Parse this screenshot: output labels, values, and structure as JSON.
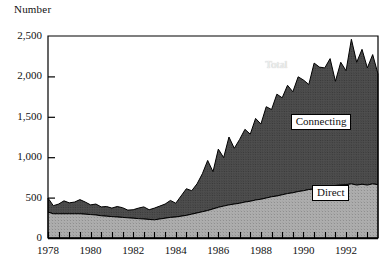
{
  "chart_data": {
    "type": "area",
    "title": "",
    "ylabel": "Number",
    "xlabel": "",
    "ylim": [
      0,
      2500
    ],
    "xlim": [
      1978,
      1993.5
    ],
    "grid": false,
    "stacked": true,
    "legend_position": "inline-annotations",
    "yticks": [
      "0",
      "500",
      "1,000",
      "1,500",
      "2,000",
      "2,500"
    ],
    "ytick_values": [
      0,
      500,
      1000,
      1500,
      2000,
      2500
    ],
    "xticks": [
      "1978",
      "1980",
      "1982",
      "1984",
      "1986",
      "1988",
      "1990",
      "1992"
    ],
    "xtick_values": [
      1978,
      1980,
      1982,
      1984,
      1986,
      1988,
      1990,
      1992
    ],
    "minor_xtick_interval": 0.5,
    "annotations": [
      {
        "text": "Total",
        "x": 1988.2,
        "y": 2130,
        "style": "plain"
      },
      {
        "text": "Connecting",
        "x": 1989.4,
        "y": 1430,
        "style": "boxed"
      },
      {
        "text": "Direct",
        "x": 1990.4,
        "y": 560,
        "style": "boxed"
      }
    ],
    "colors": {
      "direct": "#9e9e9e",
      "connecting": "#4a4a4a",
      "outline": "#000000",
      "background": "#ffffff",
      "text": "#111111"
    },
    "x": [
      1978.0,
      1978.25,
      1978.5,
      1978.75,
      1979.0,
      1979.25,
      1979.5,
      1979.75,
      1980.0,
      1980.25,
      1980.5,
      1980.75,
      1981.0,
      1981.25,
      1981.5,
      1981.75,
      1982.0,
      1982.25,
      1982.5,
      1982.75,
      1983.0,
      1983.25,
      1983.5,
      1983.75,
      1984.0,
      1984.25,
      1984.5,
      1984.75,
      1985.0,
      1985.25,
      1985.5,
      1985.75,
      1986.0,
      1986.25,
      1986.5,
      1986.75,
      1987.0,
      1987.25,
      1987.5,
      1987.75,
      1988.0,
      1988.25,
      1988.5,
      1988.75,
      1989.0,
      1989.25,
      1989.5,
      1989.75,
      1990.0,
      1990.25,
      1990.5,
      1990.75,
      1991.0,
      1991.25,
      1991.5,
      1991.75,
      1992.0,
      1992.25,
      1992.5,
      1992.75,
      1993.0,
      1993.25,
      1993.5
    ],
    "series": [
      {
        "name": "Direct",
        "fill": "#9e9e9e",
        "values": [
          320,
          300,
          300,
          300,
          300,
          300,
          300,
          295,
          290,
          285,
          275,
          270,
          265,
          260,
          255,
          250,
          245,
          240,
          235,
          230,
          225,
          235,
          245,
          255,
          260,
          270,
          280,
          295,
          310,
          325,
          340,
          360,
          380,
          395,
          410,
          420,
          430,
          445,
          455,
          470,
          480,
          495,
          510,
          520,
          535,
          550,
          560,
          575,
          585,
          600,
          605,
          615,
          625,
          640,
          650,
          655,
          660,
          670,
          655,
          665,
          655,
          670,
          660
        ]
      },
      {
        "name": "Connecting",
        "fill": "#4a4a4a",
        "values": [
          175,
          100,
          120,
          160,
          135,
          145,
          175,
          150,
          120,
          135,
          110,
          120,
          105,
          130,
          120,
          95,
          105,
          130,
          150,
          120,
          145,
          160,
          175,
          210,
          170,
          250,
          330,
          290,
          360,
          470,
          620,
          460,
          720,
          600,
          840,
          690,
          790,
          900,
          830,
          1010,
          930,
          1130,
          1080,
          1260,
          1200,
          1340,
          1250,
          1420,
          1370,
          1300,
          1560,
          1500,
          1480,
          1580,
          1290,
          1520,
          1410,
          1790,
          1520,
          1670,
          1450,
          1600,
          1370
        ]
      }
    ],
    "total_values": [
      495,
      400,
      420,
      460,
      435,
      445,
      475,
      445,
      410,
      420,
      385,
      390,
      370,
      390,
      375,
      345,
      350,
      370,
      385,
      350,
      370,
      395,
      420,
      465,
      430,
      520,
      610,
      585,
      670,
      795,
      960,
      820,
      1100,
      995,
      1250,
      1110,
      1220,
      1345,
      1285,
      1480,
      1410,
      1625,
      1590,
      1780,
      1735,
      1890,
      1810,
      1995,
      1955,
      1900,
      2165,
      2115,
      2105,
      2220,
      1940,
      2175,
      2070,
      2460,
      2175,
      2335,
      2105,
      2270,
      2030
    ]
  }
}
